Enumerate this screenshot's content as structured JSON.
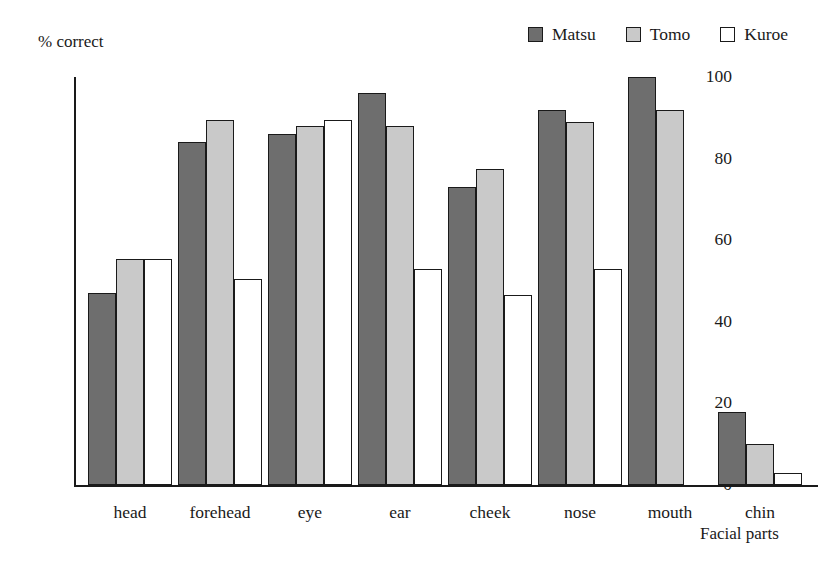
{
  "chart_data": {
    "type": "bar",
    "title": "",
    "xlabel": "Facial parts",
    "ylabel": "% correct",
    "categories": [
      "head",
      "forehead",
      "eye",
      "ear",
      "cheek",
      "nose",
      "mouth",
      "chin"
    ],
    "series": [
      {
        "name": "Matsu",
        "color": "#6e6e6e",
        "values": [
          47,
          84,
          86,
          96,
          73,
          92,
          100,
          18
        ]
      },
      {
        "name": "Tomo",
        "color": "#c9c9c9",
        "values": [
          55.5,
          89.5,
          88,
          88,
          77.5,
          89,
          92,
          10
        ]
      },
      {
        "name": "Kuroe",
        "color": "#ffffff",
        "values": [
          55.5,
          50.5,
          89.5,
          53,
          46.5,
          53,
          0,
          3
        ]
      }
    ],
    "ylim": [
      0,
      100
    ],
    "yticks": [
      0,
      20,
      40,
      60,
      80,
      100
    ],
    "ytick_labels": [
      "0",
      "20",
      "40",
      "60",
      "80",
      "100"
    ],
    "grid": false,
    "legend_position": "top-right",
    "bar_edge_color": "#1a1a1a"
  },
  "legend": {
    "items": [
      {
        "label": "Matsu"
      },
      {
        "label": "Tomo"
      },
      {
        "label": "Kuroe"
      }
    ]
  }
}
